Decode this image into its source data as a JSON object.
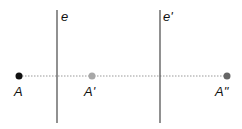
{
  "diagram": {
    "type": "reflection across two parallel lines",
    "lines": [
      {
        "label": "e",
        "x": 57,
        "y1": 10,
        "y2": 123
      },
      {
        "label": "e'",
        "x": 160,
        "y1": 10,
        "y2": 123
      }
    ],
    "points": [
      {
        "label": "A",
        "x": 19,
        "y": 76,
        "color": "#111111"
      },
      {
        "label": "A'",
        "x": 92,
        "y": 76,
        "color": "#a8a8a8"
      },
      {
        "label": "A\"",
        "x": 227,
        "y": 76,
        "color": "#666666"
      }
    ],
    "dotted_line": {
      "x1": 19,
      "x2": 227,
      "y": 76,
      "color": "#999999"
    },
    "line_color": "#555555"
  }
}
